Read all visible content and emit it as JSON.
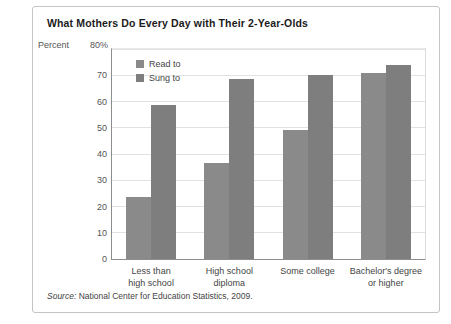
{
  "title": "What Mothers Do Every Day with Their 2-Year-Olds",
  "axis": {
    "percent_word": "Percent",
    "top_tick": "80%"
  },
  "source": {
    "prefix": "Source:",
    "text": "National Center for Education Statistics, 2009."
  },
  "colors": {
    "read_to": "#8a8a8a",
    "sung_to": "#7e7e7e",
    "grid": "#e2e2e2",
    "axis": "#8d8d8d",
    "frame": "#c4c4c4",
    "title_text": "#1b1b1b",
    "label_text": "#444444"
  },
  "chart_data": {
    "type": "bar",
    "title": "What Mothers Do Every Day with Their 2-Year-Olds",
    "xlabel": "",
    "ylabel": "Percent",
    "ylim": [
      0,
      80
    ],
    "yticks": [
      0,
      10,
      20,
      30,
      40,
      50,
      60,
      70,
      80
    ],
    "ytick_labels": [
      "0",
      "10",
      "20",
      "30",
      "40",
      "50",
      "60",
      "70",
      "80%"
    ],
    "grid": true,
    "legend_position": "top-left inside plot",
    "categories": [
      "Less than high school",
      "High school diploma",
      "Some college",
      "Bachelor's degree or higher"
    ],
    "category_lines": [
      [
        "Less than",
        "high school"
      ],
      [
        "High school",
        "diploma"
      ],
      [
        "Some college",
        ""
      ],
      [
        "Bachelor's degree",
        "or higher"
      ]
    ],
    "series": [
      {
        "name": "Read to",
        "values": [
          23.5,
          36.5,
          49,
          71
        ],
        "color": "#8a8a8a"
      },
      {
        "name": "Sung to",
        "values": [
          58.5,
          68.5,
          70,
          74
        ],
        "color": "#7e7e7e"
      }
    ]
  }
}
